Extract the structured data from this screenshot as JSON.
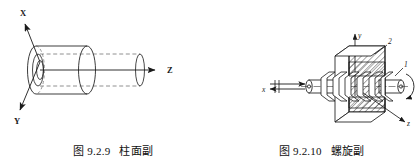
{
  "page": {
    "background": "#ffffff",
    "ink": "#1a1a1a",
    "width": 417,
    "height": 159
  },
  "figures": [
    {
      "id": "cylindrical-pair",
      "caption_number": "图 9.2.9",
      "caption_title": "柱面副",
      "description": "柱面副：圆柱面与圆柱销构成的运动副，可沿 Z 轴移动并绕 Z 轴转动",
      "axes": [
        {
          "name": "X",
          "label": "X",
          "direction": "upper-left"
        },
        {
          "name": "Y",
          "label": "Y",
          "direction": "lower-left"
        },
        {
          "name": "Z",
          "label": "Z",
          "direction": "right"
        }
      ],
      "parts": [
        {
          "name": "outer-sleeve",
          "type": "hollow-cylinder"
        },
        {
          "name": "inner-rod",
          "type": "cylinder",
          "style": "dashed-hidden"
        }
      ]
    },
    {
      "id": "helical-pair",
      "caption_number": "图 9.2.10",
      "caption_title": "螺旋副",
      "description": "螺旋副：螺杆与螺母组成的运动副，沿 x 轴移动与绕 x 轴转动相耦合",
      "axes": [
        {
          "name": "y",
          "label": "y",
          "direction": "up"
        },
        {
          "name": "x",
          "label": "x",
          "direction": "left"
        },
        {
          "name": "z",
          "label": "z",
          "direction": "lower-right"
        }
      ],
      "part_labels": [
        {
          "name": "screw-shaft",
          "label": "1"
        },
        {
          "name": "nut-block",
          "label": "2"
        }
      ],
      "motion": [
        {
          "name": "translation-arrow",
          "type": "double-headed-arrow",
          "axis": "x"
        },
        {
          "name": "rotation-arrow",
          "type": "curved-arrow",
          "axis": "x"
        }
      ]
    }
  ]
}
